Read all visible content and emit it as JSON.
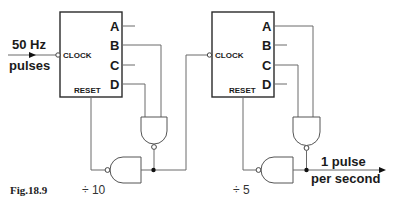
{
  "figure": {
    "caption": "Fig.18.9",
    "input_label_line1": "50 Hz",
    "input_label_line2": "pulses",
    "output_label_line1": "1 pulse",
    "output_label_line2": "per second"
  },
  "counters": [
    {
      "name": "divide-by-10 counter",
      "divider_label": "÷ 10",
      "outputs": [
        "A",
        "B",
        "C",
        "D"
      ],
      "clock_label": "CLOCK",
      "reset_label": "RESET",
      "decode_outputs": [
        "B",
        "D"
      ]
    },
    {
      "name": "divide-by-5 counter",
      "divider_label": "÷ 5",
      "outputs": [
        "A",
        "B",
        "C",
        "D"
      ],
      "clock_label": "CLOCK",
      "reset_label": "RESET",
      "decode_outputs": [
        "A",
        "C"
      ]
    }
  ],
  "colors": {
    "wire": "#6a6a6a",
    "box": "#2a2a2a",
    "text": "#1a1a1a",
    "background": "#ffffff"
  }
}
